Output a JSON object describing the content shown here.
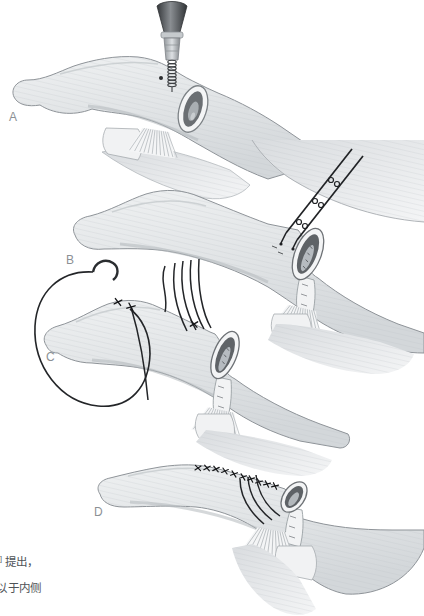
{
  "figure_type": "surgical-procedure-illustration",
  "panels": [
    {
      "label": "A"
    },
    {
      "label": "B"
    },
    {
      "label": "C"
    },
    {
      "label": "D"
    }
  ],
  "caption": {
    "superscript_fragment": "]",
    "line1": "提出，",
    "line2_clipped_char": "以",
    "line2": "于内侧"
  },
  "colors": {
    "background": "#ffffff",
    "outline": "#8e9398",
    "bone_fill": "#e3e6e8",
    "cavity": "#63676b",
    "suture": "#202225",
    "metal_dark": "#3a3d40",
    "label": "#8b9094",
    "caption_text": "#4f5357"
  }
}
